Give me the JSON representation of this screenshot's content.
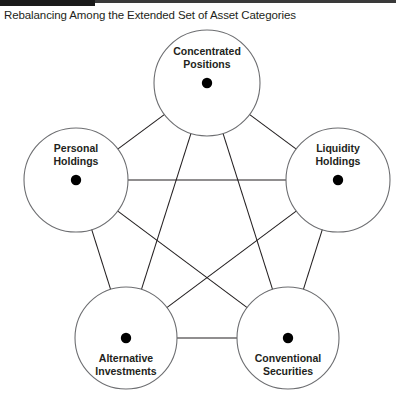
{
  "figure": {
    "title": "Rebalancing Among the Extended Set of Asset Categories",
    "accent_bar_color": "#1a1a1a",
    "rule_color": "#3a3a3a",
    "background_color": "#ffffff",
    "node_dot_color": "#000000",
    "circle_stroke_color": "#6d6e71",
    "edge_color": "#231f20",
    "type": "node-link diagram",
    "graph": "complete pentagon, every node connected to every other node with bidirectional arrows"
  },
  "nodes": [
    {
      "id": "concentrated-positions",
      "label_line1": "Concentrated",
      "label_line2": "Positions",
      "cx": 207,
      "cy": 61,
      "r": 53,
      "label_anchor": "above"
    },
    {
      "id": "liquidity-holdings",
      "label_line1": "Liquidity",
      "label_line2": "Holdings",
      "cx": 338,
      "cy": 158,
      "r": 52,
      "label_anchor": "above"
    },
    {
      "id": "conventional-securities",
      "label_line1": "Conventional",
      "label_line2": "Securities",
      "cx": 288,
      "cy": 316,
      "r": 51,
      "label_anchor": "below"
    },
    {
      "id": "alternative-investments",
      "label_line1": "Alternative",
      "label_line2": "Investments",
      "cx": 126,
      "cy": 316,
      "r": 51,
      "label_anchor": "below"
    },
    {
      "id": "personal-holdings",
      "label_line1": "Personal",
      "label_line2": "Holdings",
      "cx": 76,
      "cy": 158,
      "r": 52,
      "label_anchor": "above"
    }
  ],
  "edges": [
    {
      "from": "concentrated-positions",
      "to": "liquidity-holdings",
      "bidirectional": true
    },
    {
      "from": "concentrated-positions",
      "to": "conventional-securities",
      "bidirectional": true
    },
    {
      "from": "concentrated-positions",
      "to": "alternative-investments",
      "bidirectional": true
    },
    {
      "from": "concentrated-positions",
      "to": "personal-holdings",
      "bidirectional": true
    },
    {
      "from": "liquidity-holdings",
      "to": "conventional-securities",
      "bidirectional": true
    },
    {
      "from": "liquidity-holdings",
      "to": "alternative-investments",
      "bidirectional": true
    },
    {
      "from": "liquidity-holdings",
      "to": "personal-holdings",
      "bidirectional": true
    },
    {
      "from": "conventional-securities",
      "to": "alternative-investments",
      "bidirectional": true
    },
    {
      "from": "conventional-securities",
      "to": "personal-holdings",
      "bidirectional": true
    },
    {
      "from": "alternative-investments",
      "to": "personal-holdings",
      "bidirectional": true
    }
  ]
}
